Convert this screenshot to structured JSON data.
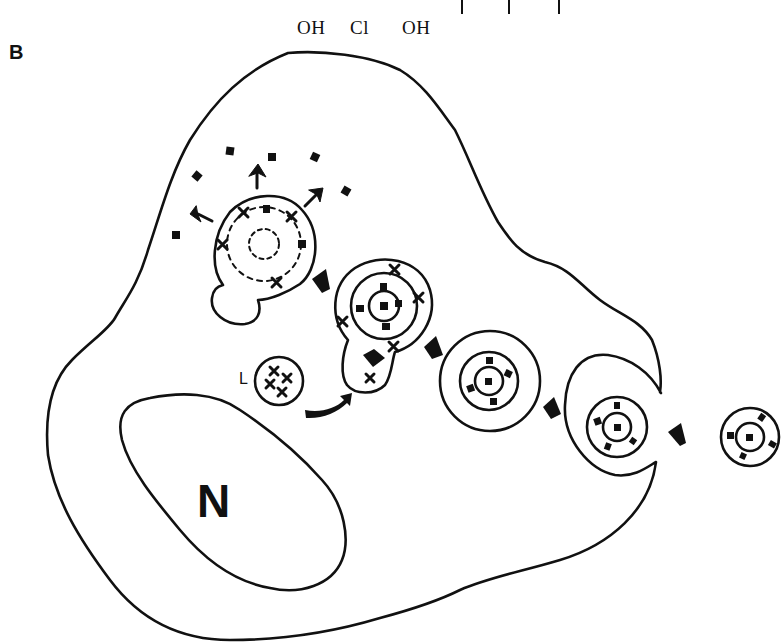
{
  "figure": {
    "panel_label": "B",
    "top_formula_fragment": {
      "substituents": [
        "OH",
        "Cl",
        "OH"
      ]
    },
    "labels": {
      "nucleus": "N",
      "lysosome": "L"
    },
    "colors": {
      "ink": "#111111",
      "background": "#ffffff"
    }
  },
  "legend_symbols": {
    "filled_square": "ligand / cargo",
    "cross": "lysosomal enzyme",
    "bold_arrow": "direction of transport",
    "dashed_circle": "degrading particle"
  }
}
